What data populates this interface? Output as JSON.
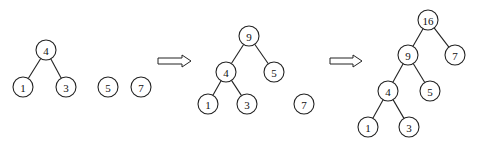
{
  "diagram": {
    "type": "huffman-tree-merge-steps",
    "panels": [
      {
        "id": "step-1",
        "nodes": [
          {
            "id": "p1n4",
            "label": "4"
          },
          {
            "id": "p1n1",
            "label": "1"
          },
          {
            "id": "p1n3",
            "label": "3"
          },
          {
            "id": "p1n5",
            "label": "5"
          },
          {
            "id": "p1n7",
            "label": "7"
          }
        ],
        "edges": [
          [
            "p1n4",
            "p1n1"
          ],
          [
            "p1n4",
            "p1n3"
          ]
        ]
      },
      {
        "id": "step-2",
        "nodes": [
          {
            "id": "p2n9",
            "label": "9"
          },
          {
            "id": "p2n4",
            "label": "4"
          },
          {
            "id": "p2n5",
            "label": "5"
          },
          {
            "id": "p2n1",
            "label": "1"
          },
          {
            "id": "p2n3",
            "label": "3"
          },
          {
            "id": "p2n7",
            "label": "7"
          }
        ],
        "edges": [
          [
            "p2n9",
            "p2n4"
          ],
          [
            "p2n9",
            "p2n5"
          ],
          [
            "p2n4",
            "p2n1"
          ],
          [
            "p2n4",
            "p2n3"
          ]
        ]
      },
      {
        "id": "step-3",
        "nodes": [
          {
            "id": "p3n16",
            "label": "16"
          },
          {
            "id": "p3n9",
            "label": "9"
          },
          {
            "id": "p3n7",
            "label": "7"
          },
          {
            "id": "p3n4",
            "label": "4"
          },
          {
            "id": "p3n5",
            "label": "5"
          },
          {
            "id": "p3n1",
            "label": "1"
          },
          {
            "id": "p3n3",
            "label": "3"
          }
        ],
        "edges": [
          [
            "p3n16",
            "p3n9"
          ],
          [
            "p3n16",
            "p3n7"
          ],
          [
            "p3n9",
            "p3n4"
          ],
          [
            "p3n9",
            "p3n5"
          ],
          [
            "p3n4",
            "p3n1"
          ],
          [
            "p3n4",
            "p3n3"
          ]
        ]
      }
    ],
    "arrows": [
      {
        "from": "step-1",
        "to": "step-2",
        "icon": "double-right-arrow-icon"
      },
      {
        "from": "step-2",
        "to": "step-3",
        "icon": "double-right-arrow-icon"
      }
    ]
  }
}
